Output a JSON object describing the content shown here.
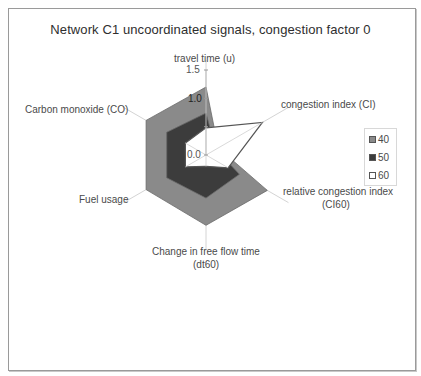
{
  "chart_data": {
    "type": "radar",
    "title": "Network C1 uncoordinated signals, congestion factor 0",
    "axes": [
      "travel time (u)",
      "congestion index (CI)",
      "relative congestion index (CI60)",
      "Change in free flow time (dt60)",
      "Fuel usage",
      "Carbon monoxide (CO)"
    ],
    "radial_ticks": [
      "0.0",
      "1.0",
      "1.5"
    ],
    "rlim": [
      0,
      1.5
    ],
    "series": [
      {
        "name": "40",
        "values": [
          1.2,
          0.25,
          1.25,
          1.24,
          1.22,
          1.22
        ],
        "color": "#8a8a8a"
      },
      {
        "name": "50",
        "values": [
          0.74,
          0.2,
          0.68,
          0.76,
          0.8,
          0.8
        ],
        "color": "#3c3c3c"
      },
      {
        "name": "60",
        "values": [
          0.48,
          1.15,
          0.45,
          0.2,
          0.42,
          0.42
        ],
        "color": "#ffffff"
      }
    ],
    "legend_position": "right"
  },
  "title": "Network C1 uncoordinated signals, congestion factor 0",
  "axis_labels": {
    "travel_time": "travel time (u)",
    "congestion_index": "congestion index (CI)",
    "relative_ci_line1": "relative congestion index",
    "relative_ci_line2": "(CI60)",
    "dt60_line1": "Change in free flow time",
    "dt60_line2": "(dt60)",
    "fuel": "Fuel usage",
    "co": "Carbon monoxide (CO)"
  },
  "ticks": {
    "t0": "0.0",
    "t1": "1.0",
    "t15": "1.5"
  },
  "legend": {
    "items": [
      {
        "label": "40",
        "color": "#8a8a8a"
      },
      {
        "label": "50",
        "color": "#3c3c3c"
      },
      {
        "label": "60",
        "color": "#ffffff"
      }
    ]
  }
}
